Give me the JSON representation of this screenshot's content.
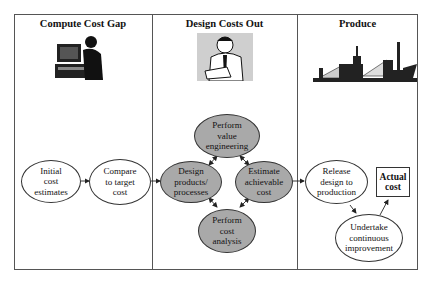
{
  "columns": [
    {
      "title": "Compute Cost Gap",
      "illustration": "person-at-computer-icon"
    },
    {
      "title": "Design Costs Out",
      "illustration": "thinking-man-icon"
    },
    {
      "title": "Produce",
      "illustration": "factory-icon"
    }
  ],
  "nodes": {
    "initial": "Initial\ncost\nestimates",
    "compare": "Compare\nto target\ncost",
    "value_eng": "Perform\nvalue\nengineering",
    "design": "Design\nproducts/\nprocesses",
    "estimate": "Estimate\nachievable\ncost",
    "cost_analysis": "Perform\ncost\nanalysis",
    "release": "Release\ndesign to\nproduction",
    "actual": "Actual\ncost",
    "improve": "Undertake\ncontinuous\nimprovement"
  },
  "colors": {
    "shaded_node": "#a9a9a9",
    "line": "#333333"
  }
}
